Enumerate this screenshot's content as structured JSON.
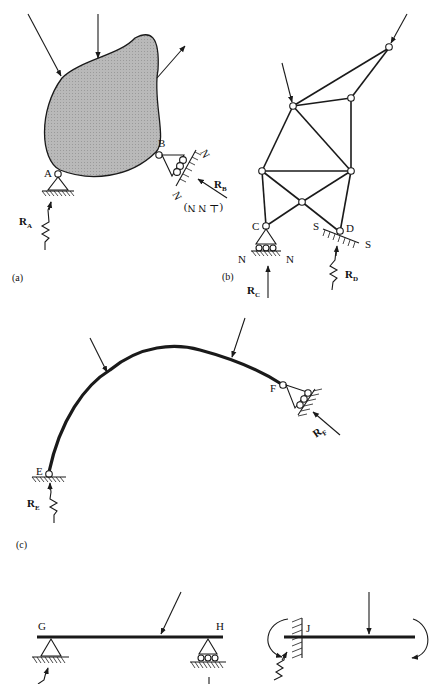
{
  "figure": {
    "panels": [
      {
        "id": "a",
        "caption": "(a)",
        "body": "irregular rigid body (shaded)",
        "points": [
          {
            "name": "A",
            "label": "A",
            "support": "pin on hatched ground",
            "reaction": "R",
            "reaction_sub": "A"
          },
          {
            "name": "B",
            "label": "B",
            "support": "roller on inclined surface N-N",
            "reaction": "R",
            "reaction_sub": "B",
            "reaction_note": "(⊥ N N)",
            "surface_label_1": "N",
            "surface_label_2": "N"
          }
        ]
      },
      {
        "id": "b",
        "caption": "(b)",
        "body": "pin-jointed truss",
        "points": [
          {
            "name": "C",
            "label": "C",
            "support": "roller on surface N-N",
            "reaction": "R",
            "reaction_sub": "C",
            "surface_label_1": "N",
            "surface_label_2": "N"
          },
          {
            "name": "D",
            "label": "D",
            "support": "hinge on inclined surface S-S",
            "reaction": "R",
            "reaction_sub": "D",
            "surface_label_1": "S",
            "surface_label_2": "S"
          }
        ]
      },
      {
        "id": "c",
        "caption": "(c)",
        "body": "curved arch member",
        "points": [
          {
            "name": "E",
            "label": "E",
            "support": "hinge on ground",
            "reaction": "R",
            "reaction_sub": "E"
          },
          {
            "name": "F",
            "label": "F",
            "support": "roller on inclined surface",
            "reaction": "R",
            "reaction_sub": "F"
          }
        ]
      },
      {
        "id": "d",
        "caption": "",
        "body": "simply supported beam",
        "points": [
          {
            "name": "G",
            "label": "G",
            "support": "pin"
          },
          {
            "name": "H",
            "label": "H",
            "support": "roller"
          }
        ]
      },
      {
        "id": "e",
        "caption": "",
        "body": "cantilever beam with applied moments",
        "points": [
          {
            "name": "J",
            "label": "J",
            "support": "fixed wall"
          }
        ]
      }
    ]
  }
}
